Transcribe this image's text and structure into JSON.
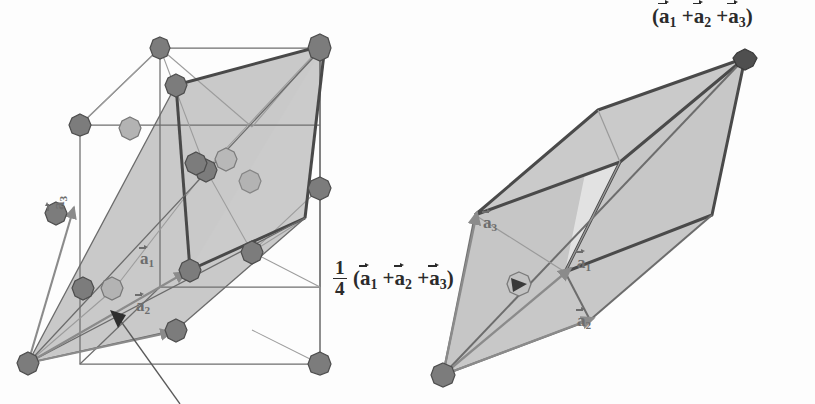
{
  "figure": {
    "background": "#fdfdfd",
    "colors": {
      "atom_fill": "#7c7c7c",
      "atom_fill_light": "#a9a9a9",
      "atom_stroke": "#4a4a4a",
      "plane_shade": "#c6c6c6",
      "plane_shade_light": "#cfcfcf",
      "cube_edge": "#6e6e6e",
      "heavy_edge": "#494949",
      "vector_grey": "#8b8b8b",
      "text": "#2b2b2b",
      "leader": "#5a5a5a"
    }
  },
  "left_panel": {
    "name": "fcc-conventional-cell",
    "vector_labels": [
      {
        "id": "a1",
        "base": "a",
        "sub": "1",
        "x": 140,
        "y": 258
      },
      {
        "id": "a2",
        "base": "a",
        "sub": "2",
        "x": 136,
        "y": 305
      },
      {
        "id": "a3",
        "base": "a",
        "sub": "3",
        "x": 58,
        "y": 216
      }
    ],
    "leader_note": "leader line with arrowhead pointing into the shaded (111) plane"
  },
  "right_panel": {
    "name": "primitive-rhombohedral-cell",
    "corner_label": {
      "id": "sum-vector-label",
      "text_parts": [
        "(",
        "a",
        "1",
        "+",
        "a",
        "2",
        "+",
        "a",
        "3",
        ")"
      ],
      "plain": "(a1 + a2 + a3)",
      "x": 650,
      "y": 8
    },
    "center_label": {
      "id": "quarter-sum-vector-label",
      "fraction_num": "1",
      "fraction_den": "4",
      "plain": "1/4 (a1 + a2 + a3)",
      "x": 338,
      "y": 258
    },
    "vector_labels": [
      {
        "id": "a1",
        "base": "a",
        "sub": "1",
        "x": 578,
        "y": 262
      },
      {
        "id": "a2",
        "base": "a",
        "sub": "2",
        "x": 578,
        "y": 320
      },
      {
        "id": "a3",
        "base": "a",
        "sub": "3",
        "x": 487,
        "y": 220
      }
    ]
  }
}
